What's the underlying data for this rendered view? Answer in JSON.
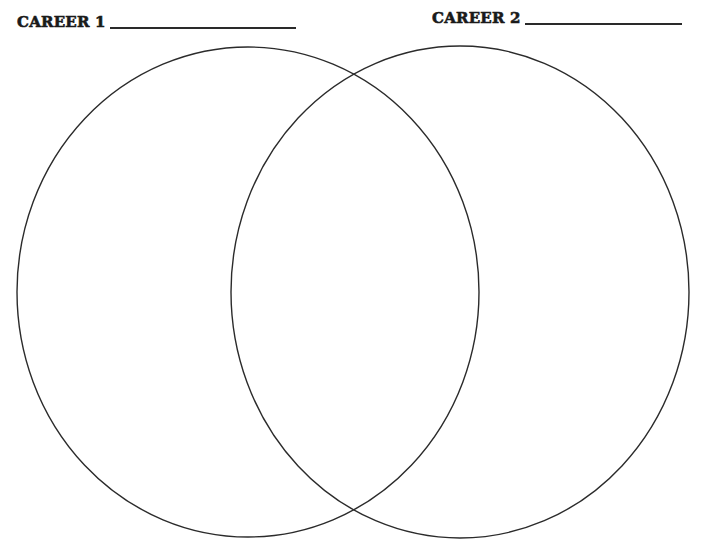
{
  "worksheet": {
    "type": "venn-diagram",
    "labels": [
      {
        "id": "career-1",
        "text": "CAREER 1",
        "blank_line": ""
      },
      {
        "id": "career-2",
        "text": "CAREER 2",
        "blank_line": ""
      }
    ],
    "circles": [
      {
        "id": "career-1-circle",
        "cx": 248,
        "cy": 292,
        "rx": 231,
        "ry": 245
      },
      {
        "id": "career-2-circle",
        "cx": 460,
        "cy": 292,
        "rx": 229,
        "ry": 246
      }
    ],
    "colors": {
      "stroke": "#2b2b2b",
      "text": "#1a1a1a",
      "background": "#ffffff"
    }
  }
}
